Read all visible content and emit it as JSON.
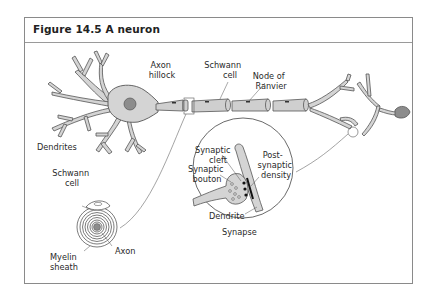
{
  "figure": {
    "title": "Figure 14.5 A neuron"
  },
  "labels": {
    "axon_hillock": [
      "Axon",
      "hillock"
    ],
    "schwann_cell_top": [
      "Schwann",
      "cell"
    ],
    "node_of_ranvier": [
      "Node of",
      "Ranvier"
    ],
    "dendrites": "Dendrites",
    "schwann_cell_inset": [
      "Schwann",
      "cell"
    ],
    "axon": "Axon",
    "myelin_sheath": [
      "Myelin",
      "sheath"
    ],
    "synaptic_cleft": [
      "Synaptic",
      "cleft"
    ],
    "synaptic_bouton": [
      "Synaptic",
      "bouton"
    ],
    "post_synaptic_density": [
      "Post-",
      "synaptic",
      "density"
    ],
    "dendrite": "Dendrite",
    "synapse": "Synapse"
  },
  "colors": {
    "cell_fill": "#d4d4d4",
    "nucleus": "#8c8c8c",
    "outline": "#555555",
    "frame": "#8a8a8a"
  }
}
